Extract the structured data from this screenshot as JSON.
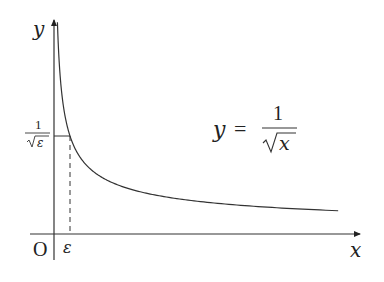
{
  "diagram": {
    "function": "y = 1/sqrt(x)",
    "axis_labels": {
      "x": "x",
      "y": "y",
      "origin": "O"
    },
    "x_marker": {
      "label": "ε",
      "value": 0.0625
    },
    "y_marker": {
      "numerator": "1",
      "denominator_radicand": "ε",
      "value": 4
    },
    "equation_label": {
      "lhs": "y",
      "equals": "=",
      "numerator": "1",
      "radicand": "x"
    },
    "curve_domain": [
      0.0134,
      1.11
    ],
    "colors": {
      "stroke": "#333333",
      "text": "#222222"
    }
  }
}
